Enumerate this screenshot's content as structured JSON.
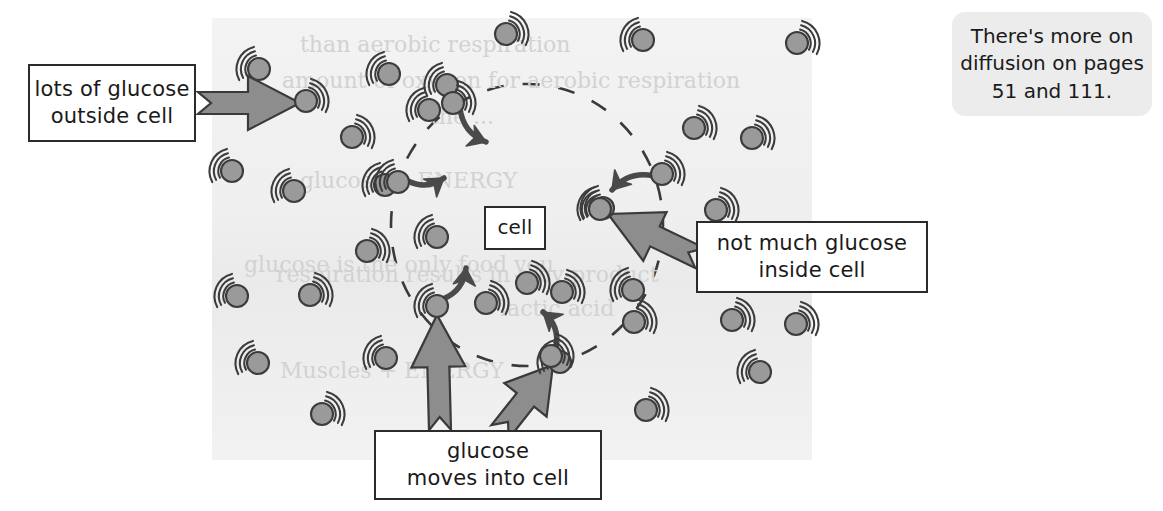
{
  "page": {
    "width": 1163,
    "height": 511,
    "background": "#ffffff"
  },
  "diagram": {
    "name": "glucose-diffusion-into-cell",
    "panel": {
      "x": 212,
      "y": 18,
      "width": 600,
      "height": 442,
      "fill": "#f1f1f1"
    },
    "cell_boundary": {
      "style": "dashed-circle",
      "cx": 527,
      "cy": 225,
      "rx": 136,
      "ry": 141,
      "stroke": "#3a3a3a"
    },
    "colors": {
      "molecule_fill": "#9a9a9a",
      "molecule_stroke": "#3c3c3c",
      "arrow_fill": "#8d8d8d",
      "arrow_stroke": "#3a3a3a",
      "small_arrow_fill": "#4a4a4a",
      "box_border": "#2b2b2b",
      "panel_fill": "#f1f1f1",
      "note_fill": "#ececec",
      "text": "#1a1a1a"
    }
  },
  "labels": {
    "outside": "lots of glucose\noutside cell",
    "outside_line1": "lots of glucose",
    "outside_line2": "outside cell",
    "inside_line1": "not much glucose",
    "inside_line2": "inside cell",
    "moves_line1": "glucose",
    "moves_line2": "moves into cell",
    "cell": "cell"
  },
  "note": {
    "line1": "There's more on",
    "line2": "diffusion on pages",
    "line3": "51 and 111."
  },
  "molecules": {
    "icon": "glucose-molecule-icon",
    "description": "gray filled circle with three motion arcs",
    "count_outside": 30,
    "count_inside": 3,
    "radius": 11,
    "outside": [
      {
        "x": 259,
        "y": 69,
        "arcs": "left"
      },
      {
        "x": 306,
        "y": 101,
        "arcs": "right"
      },
      {
        "x": 389,
        "y": 74,
        "arcs": "left"
      },
      {
        "x": 447,
        "y": 85,
        "arcs": "left"
      },
      {
        "x": 506,
        "y": 34,
        "arcs": "right"
      },
      {
        "x": 643,
        "y": 40,
        "arcs": "left"
      },
      {
        "x": 797,
        "y": 43,
        "arcs": "right"
      },
      {
        "x": 352,
        "y": 137,
        "arcs": "right"
      },
      {
        "x": 232,
        "y": 171,
        "arcs": "left"
      },
      {
        "x": 294,
        "y": 191,
        "arcs": "left"
      },
      {
        "x": 385,
        "y": 185,
        "arcs": "left"
      },
      {
        "x": 694,
        "y": 128,
        "arcs": "right"
      },
      {
        "x": 752,
        "y": 138,
        "arcs": "right"
      },
      {
        "x": 437,
        "y": 237,
        "arcs": "left"
      },
      {
        "x": 603,
        "y": 208,
        "arcs": "left"
      },
      {
        "x": 716,
        "y": 210,
        "arcs": "right"
      },
      {
        "x": 237,
        "y": 296,
        "arcs": "left"
      },
      {
        "x": 310,
        "y": 295,
        "arcs": "right"
      },
      {
        "x": 367,
        "y": 251,
        "arcs": "right"
      },
      {
        "x": 258,
        "y": 363,
        "arcs": "left"
      },
      {
        "x": 386,
        "y": 358,
        "arcs": "left"
      },
      {
        "x": 322,
        "y": 414,
        "arcs": "right"
      },
      {
        "x": 560,
        "y": 362,
        "arcs": "left"
      },
      {
        "x": 634,
        "y": 322,
        "arcs": "right"
      },
      {
        "x": 732,
        "y": 320,
        "arcs": "right"
      },
      {
        "x": 796,
        "y": 324,
        "arcs": "right"
      },
      {
        "x": 760,
        "y": 372,
        "arcs": "left"
      },
      {
        "x": 646,
        "y": 410,
        "arcs": "right"
      },
      {
        "x": 429,
        "y": 110,
        "arcs": "left"
      },
      {
        "x": 633,
        "y": 290,
        "arcs": "left"
      }
    ],
    "inside": [
      {
        "x": 527,
        "y": 283,
        "arcs": "right"
      },
      {
        "x": 562,
        "y": 292,
        "arcs": "right"
      },
      {
        "x": 486,
        "y": 303,
        "arcs": "right"
      }
    ],
    "crossing": [
      {
        "x": 453,
        "y": 103,
        "arcs": "right",
        "direction": "in-top"
      },
      {
        "x": 398,
        "y": 182,
        "arcs": "left",
        "direction": "in-left"
      },
      {
        "x": 662,
        "y": 174,
        "arcs": "right",
        "direction": "in-right"
      },
      {
        "x": 600,
        "y": 209,
        "arcs": "left",
        "direction": "pointer-target"
      },
      {
        "x": 437,
        "y": 306,
        "arcs": "left",
        "direction": "in-bottom-left"
      },
      {
        "x": 551,
        "y": 356,
        "arcs": "right",
        "direction": "in-bottom-right"
      }
    ]
  },
  "arrows": {
    "big": [
      {
        "name": "arrow-outside-to-molecule",
        "from": [
          198,
          103
        ],
        "to": [
          300,
          103
        ]
      },
      {
        "name": "arrow-inside-label-to-molecule",
        "from": [
          700,
          258
        ],
        "to": [
          608,
          214
        ]
      },
      {
        "name": "arrow-moves-to-molecule-left",
        "from": [
          440,
          430
        ],
        "to": [
          437,
          315
        ]
      },
      {
        "name": "arrow-moves-to-molecule-right",
        "from": [
          500,
          432
        ],
        "to": [
          553,
          365
        ]
      }
    ],
    "small": [
      {
        "name": "motion-arrow-top",
        "from": [
          460,
          108
        ],
        "to": [
          486,
          142
        ]
      },
      {
        "name": "motion-arrow-left",
        "from": [
          408,
          181
        ],
        "to": [
          444,
          178
        ]
      },
      {
        "name": "motion-arrow-right",
        "from": [
          654,
          176
        ],
        "to": [
          612,
          190
        ]
      },
      {
        "name": "motion-arrow-bottom-left",
        "from": [
          443,
          299
        ],
        "to": [
          466,
          268
        ]
      },
      {
        "name": "motion-arrow-bottom-right",
        "from": [
          556,
          348
        ],
        "to": [
          543,
          312
        ]
      }
    ]
  },
  "ghost_text": {
    "description": "faint show-through text from the reverse of the page",
    "items": [
      {
        "text": "carbon dioxide + water",
        "x": 398,
        "y": 14
      },
      {
        "text": "than aerobic respiration",
        "x": 300,
        "y": 52
      },
      {
        "text": "amount of oxygen for aerobic respiration",
        "x": 282,
        "y": 88
      },
      {
        "text": "the ...",
        "x": 430,
        "y": 124
      },
      {
        "text": "glucose          + ENERGY",
        "x": 300,
        "y": 188
      },
      {
        "text": "glucose is the only food you",
        "x": 244,
        "y": 272
      },
      {
        "text": "respiration results in a by-product",
        "x": 276,
        "y": 282
      },
      {
        "text": "lactic acid",
        "x": 500,
        "y": 316
      },
      {
        "text": "Muscles +   ENERGY",
        "x": 280,
        "y": 378
      }
    ]
  }
}
